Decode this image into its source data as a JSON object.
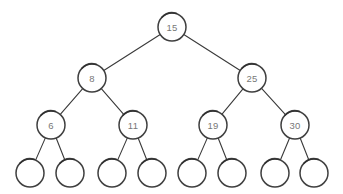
{
  "figure": {
    "kind": "binary-search-tree-diagram",
    "background_color": "#ffffff",
    "width": 343,
    "height": 194
  },
  "style": {
    "node_stroke_color": "#3f3f3f",
    "node_fill_color": "#ffffff",
    "edge_color": "#3a3a3a",
    "label_color": "#777777",
    "node_radius": 14,
    "leaf_radius": 14
  },
  "tree": {
    "levels": [
      {
        "level": 1,
        "nodes": [
          {
            "id": "n15",
            "label": "15",
            "cx": 172,
            "cy": 27,
            "r": 14,
            "is_leaf": false
          }
        ]
      },
      {
        "level": 2,
        "nodes": [
          {
            "id": "n8",
            "label": "8",
            "cx": 92,
            "cy": 78,
            "r": 14,
            "is_leaf": false
          },
          {
            "id": "n25",
            "label": "25",
            "cx": 252,
            "cy": 78,
            "r": 14,
            "is_leaf": false
          }
        ]
      },
      {
        "level": 3,
        "nodes": [
          {
            "id": "n6",
            "label": "6",
            "cx": 51,
            "cy": 125,
            "r": 14,
            "is_leaf": false
          },
          {
            "id": "n11",
            "label": "11",
            "cx": 133,
            "cy": 125,
            "r": 14,
            "is_leaf": false
          },
          {
            "id": "n19",
            "label": "19",
            "cx": 213,
            "cy": 125,
            "r": 14,
            "is_leaf": false
          },
          {
            "id": "n30",
            "label": "30",
            "cx": 295,
            "cy": 125,
            "r": 14,
            "is_leaf": false
          }
        ]
      },
      {
        "level": 4,
        "nodes": [
          {
            "id": "l1",
            "label": "",
            "cx": 30,
            "cy": 173,
            "r": 14,
            "is_leaf": true
          },
          {
            "id": "l2",
            "label": "",
            "cx": 70,
            "cy": 173,
            "r": 14,
            "is_leaf": true
          },
          {
            "id": "l3",
            "label": "",
            "cx": 112,
            "cy": 173,
            "r": 14,
            "is_leaf": true
          },
          {
            "id": "l4",
            "label": "",
            "cx": 152,
            "cy": 173,
            "r": 14,
            "is_leaf": true
          },
          {
            "id": "l5",
            "label": "",
            "cx": 192,
            "cy": 173,
            "r": 14,
            "is_leaf": true
          },
          {
            "id": "l6",
            "label": "",
            "cx": 232,
            "cy": 173,
            "r": 14,
            "is_leaf": true
          },
          {
            "id": "l7",
            "label": "",
            "cx": 275,
            "cy": 173,
            "r": 14,
            "is_leaf": true
          },
          {
            "id": "l8",
            "label": "",
            "cx": 314,
            "cy": 173,
            "r": 14,
            "is_leaf": true
          }
        ]
      }
    ],
    "edges": [
      {
        "from": "n15",
        "to": "n8"
      },
      {
        "from": "n15",
        "to": "n25"
      },
      {
        "from": "n8",
        "to": "n6"
      },
      {
        "from": "n8",
        "to": "n11"
      },
      {
        "from": "n25",
        "to": "n19"
      },
      {
        "from": "n25",
        "to": "n30"
      },
      {
        "from": "n6",
        "to": "l1"
      },
      {
        "from": "n6",
        "to": "l2"
      },
      {
        "from": "n11",
        "to": "l3"
      },
      {
        "from": "n11",
        "to": "l4"
      },
      {
        "from": "n19",
        "to": "l5"
      },
      {
        "from": "n19",
        "to": "l6"
      },
      {
        "from": "n30",
        "to": "l7"
      },
      {
        "from": "n30",
        "to": "l8"
      }
    ]
  },
  "chart_data": {
    "type": "diagram",
    "title": "",
    "structure": "binary search tree",
    "node_values": [
      15,
      8,
      25,
      6,
      11,
      19,
      30
    ],
    "leaf_count": 8,
    "depth": 4
  }
}
